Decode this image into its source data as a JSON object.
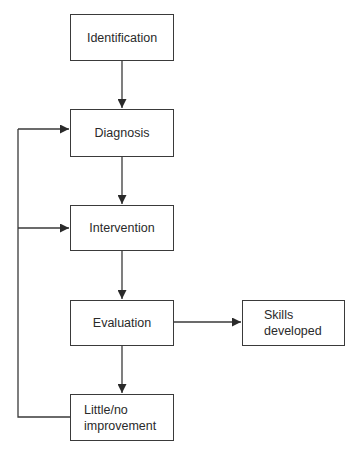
{
  "diagram": {
    "type": "flowchart",
    "nodes": [
      {
        "id": "identification",
        "label": "Identification"
      },
      {
        "id": "diagnosis",
        "label": "Diagnosis"
      },
      {
        "id": "intervention",
        "label": "Intervention"
      },
      {
        "id": "evaluation",
        "label": "Evaluation"
      },
      {
        "id": "skills_developed",
        "label": "Skills\ndeveloped"
      },
      {
        "id": "little_no_improvement",
        "label": "Little/no\nimprovement"
      }
    ],
    "edges": [
      {
        "from": "identification",
        "to": "diagnosis"
      },
      {
        "from": "diagnosis",
        "to": "intervention"
      },
      {
        "from": "intervention",
        "to": "evaluation"
      },
      {
        "from": "evaluation",
        "to": "skills_developed"
      },
      {
        "from": "evaluation",
        "to": "little_no_improvement"
      },
      {
        "from": "little_no_improvement",
        "to": "diagnosis",
        "kind": "feedback"
      },
      {
        "from": "little_no_improvement",
        "to": "intervention",
        "kind": "feedback"
      }
    ],
    "colors": {
      "line": "#3a3a3a",
      "background": "#ffffff"
    }
  }
}
